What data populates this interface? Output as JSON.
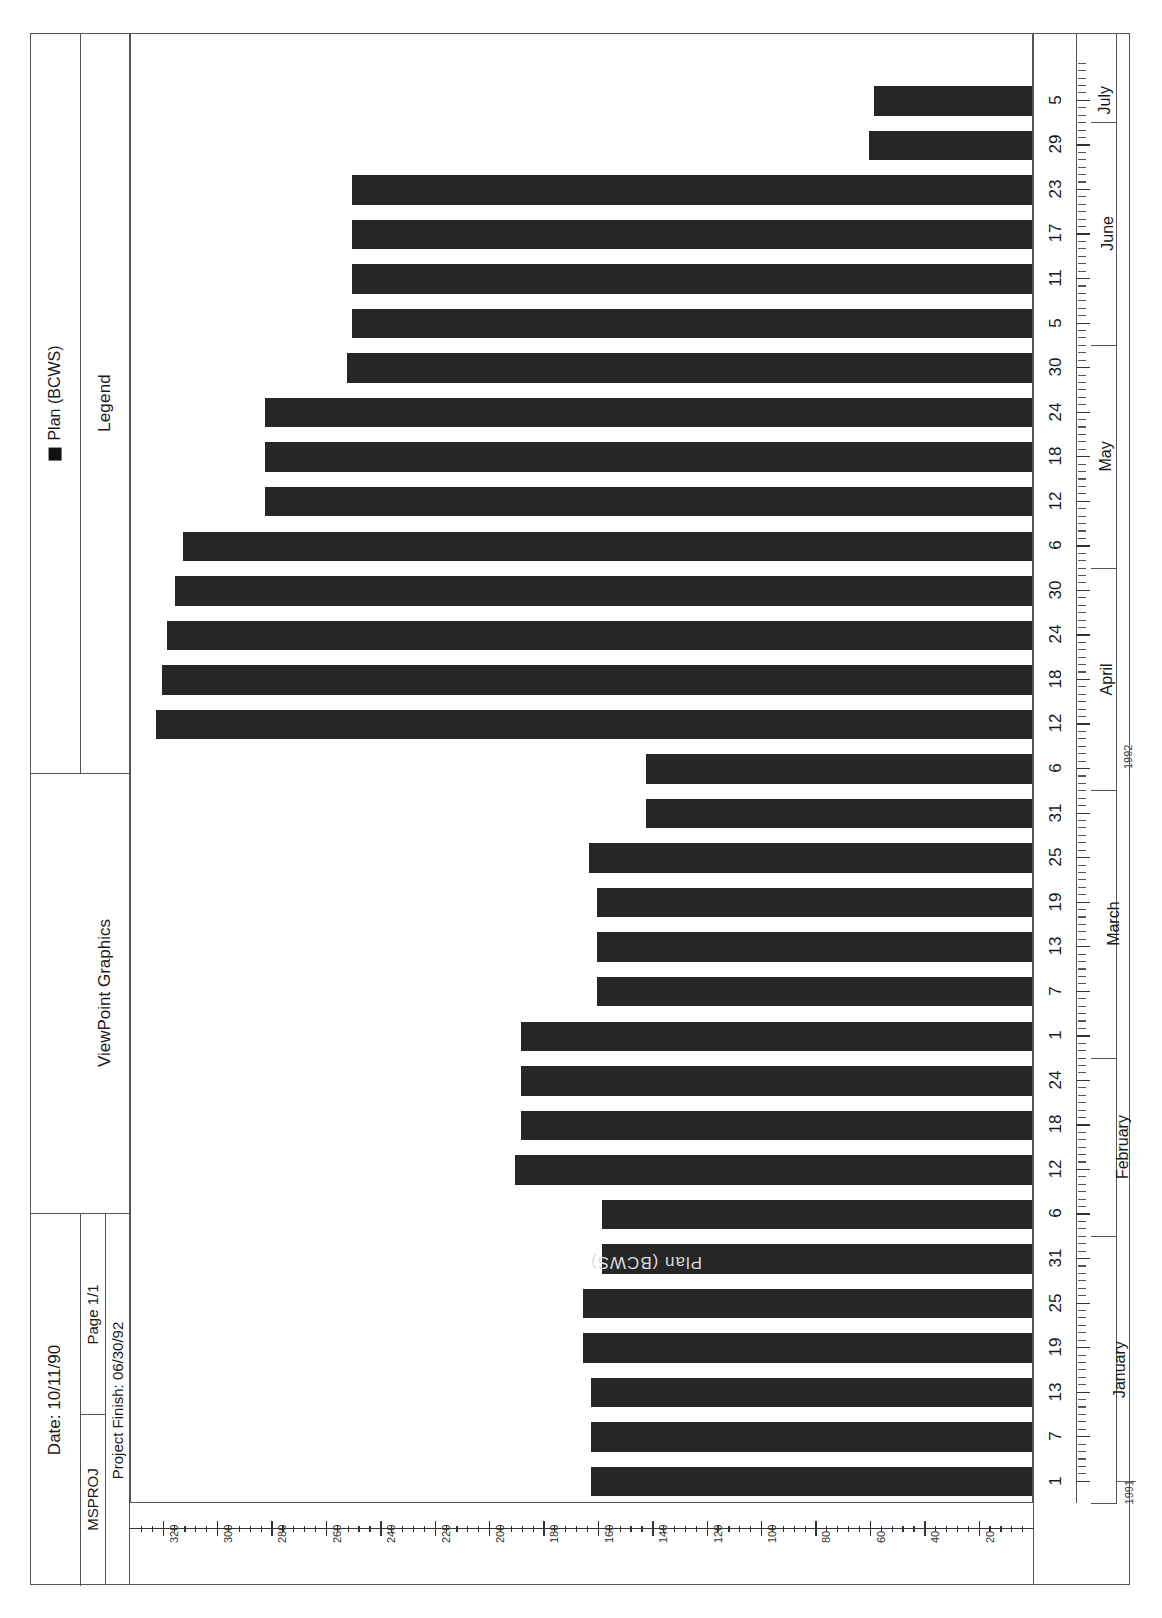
{
  "report": {
    "product_title": "ViewPoint Graphics",
    "legend_title": "Legend",
    "legend_series_label": "Plan (BCWS)",
    "legend_swatch_color": "#111111",
    "date_label": "Date:  10/11/90",
    "page_label": "Page  1/1",
    "app_label": "MSPROJ",
    "project_finish_label": "Project Finish: 06/30/92",
    "watermark_text": "Plan (BCWS)"
  },
  "chart_data": {
    "type": "bar",
    "orientation": "horizontal",
    "title": "ViewPoint Graphics",
    "xlabel": "",
    "ylabel": "",
    "ylim": [
      0,
      330
    ],
    "grid": false,
    "legend_position": "left-panel",
    "series": [
      {
        "name": "Plan (BCWS)",
        "color": "#262626",
        "values": [
          0,
          44,
          44,
          44,
          70,
          70,
          105,
          105,
          105,
          122,
          122,
          122,
          122,
          122,
          122,
          158,
          158,
          158,
          158,
          158,
          158,
          158,
          165,
          165,
          165,
          195,
          195,
          195,
          195,
          195,
          195,
          245,
          245,
          280,
          290,
          315,
          320,
          320,
          322,
          281,
          281,
          281,
          281,
          258,
          258,
          258,
          258,
          258,
          250,
          250,
          142,
          0
        ],
        "categories": [
          "Jan 1",
          "Jan 7",
          "Jan 13",
          "Jan 19",
          "Jan 25",
          "Jan 31",
          "Feb 6",
          "Feb 12",
          "Feb 18",
          "Feb 24",
          "Mar 1",
          "Mar 7",
          "Mar 13",
          "Mar 19",
          "Mar 25",
          "Mar 31",
          "Apr 6",
          "Apr 12",
          "Apr 18",
          "Apr 24",
          "Apr 30",
          "May 6",
          "May 12",
          "May 18",
          "May 24",
          "May 30",
          "Jun 5",
          "Jun 11",
          "Jun 17",
          "Jun 23",
          "Jun 29",
          "Jul 5"
        ]
      }
    ],
    "value_axis": {
      "ticks": [
        320,
        300,
        280,
        260,
        240,
        220,
        200,
        180,
        160,
        140,
        120,
        100,
        80,
        60,
        40,
        20
      ],
      "minor_per_major": 5,
      "direction": "right-to-left"
    },
    "category_axis": {
      "day_ticks": [
        "1",
        "7",
        "13",
        "19",
        "25",
        "31",
        "6",
        "12",
        "18",
        "24",
        "1",
        "7",
        "13",
        "19",
        "25",
        "31",
        "6",
        "12",
        "18",
        "24",
        "30",
        "6",
        "12",
        "18",
        "24",
        "30",
        "5",
        "11",
        "17",
        "23",
        "29",
        "5"
      ],
      "months": [
        "January",
        "February",
        "March",
        "April",
        "May",
        "June",
        "July"
      ],
      "years": [
        "1991",
        "1992"
      ]
    }
  },
  "bars": [
    {
      "cat": "1",
      "value": 162
    },
    {
      "cat": "7",
      "value": 162
    },
    {
      "cat": "13",
      "value": 162
    },
    {
      "cat": "19",
      "value": 165
    },
    {
      "cat": "25",
      "value": 165
    },
    {
      "cat": "31",
      "value": 158
    },
    {
      "cat": "6",
      "value": 158
    },
    {
      "cat": "12",
      "value": 190
    },
    {
      "cat": "18",
      "value": 188
    },
    {
      "cat": "24",
      "value": 188
    },
    {
      "cat": "1",
      "value": 188
    },
    {
      "cat": "7",
      "value": 160
    },
    {
      "cat": "13",
      "value": 160
    },
    {
      "cat": "19",
      "value": 160
    },
    {
      "cat": "25",
      "value": 163
    },
    {
      "cat": "31",
      "value": 142
    },
    {
      "cat": "6",
      "value": 142
    },
    {
      "cat": "12",
      "value": 322
    },
    {
      "cat": "18",
      "value": 320
    },
    {
      "cat": "24",
      "value": 318
    },
    {
      "cat": "30",
      "value": 315
    },
    {
      "cat": "6",
      "value": 312
    },
    {
      "cat": "12",
      "value": 282
    },
    {
      "cat": "18",
      "value": 282
    },
    {
      "cat": "24",
      "value": 282
    },
    {
      "cat": "30",
      "value": 252
    },
    {
      "cat": "5",
      "value": 250
    },
    {
      "cat": "11",
      "value": 250
    },
    {
      "cat": "17",
      "value": 250
    },
    {
      "cat": "23",
      "value": 250
    },
    {
      "cat": "29",
      "value": 60
    },
    {
      "cat": "5",
      "value": 58
    }
  ]
}
